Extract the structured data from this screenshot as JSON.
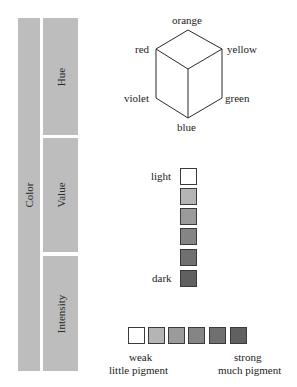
{
  "left_panel": {
    "color_label": "Color",
    "sections": [
      {
        "label": "Hue"
      },
      {
        "label": "Value"
      },
      {
        "label": "Intensity"
      }
    ],
    "bar_color": "#bdbdbd"
  },
  "hue_cube": {
    "labels": {
      "top": "orange",
      "upper_left": "red",
      "upper_right": "yellow",
      "lower_left": "violet",
      "lower_right": "green",
      "bottom": "blue"
    }
  },
  "value_scale": {
    "top_label": "light",
    "bottom_label": "dark",
    "swatches": [
      "#ffffff",
      "#b5b5b5",
      "#9b9b9b",
      "#858585",
      "#707070",
      "#606060"
    ]
  },
  "intensity_scale": {
    "left_label_line1": "weak",
    "left_label_line2": "little pigment",
    "right_label_line1": "strong",
    "right_label_line2": "much pigment",
    "swatches": [
      "#ffffff",
      "#b5b5b5",
      "#9b9b9b",
      "#858585",
      "#707070",
      "#606060"
    ]
  }
}
